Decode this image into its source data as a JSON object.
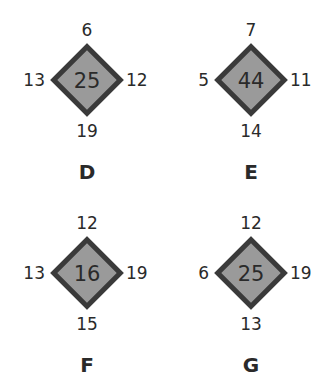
{
  "puzzles": [
    {
      "label": "D",
      "center": "25",
      "top": "6",
      "right": "12",
      "bottom": "19",
      "left": "13"
    },
    {
      "label": "E",
      "center": "44",
      "top": "7",
      "right": "11",
      "bottom": "14",
      "left": "5"
    },
    {
      "label": "F",
      "center": "16",
      "top": "12",
      "right": "19",
      "bottom": "15",
      "left": "13"
    },
    {
      "label": "G",
      "center": "25",
      "top": "12",
      "right": "19",
      "bottom": "13",
      "left": "6"
    }
  ],
  "colors": {
    "fill": "#9a9a9a",
    "border": "#3a3a3a",
    "text": "#2a2a2a"
  }
}
